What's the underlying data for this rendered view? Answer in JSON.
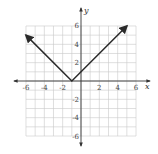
{
  "chart_data": {
    "type": "line",
    "title": "",
    "function": "y = |x + 1|",
    "xlabel": "x",
    "ylabel": "y",
    "xlim": [
      -6,
      6
    ],
    "ylim": [
      -6,
      6
    ],
    "grid": true,
    "x_ticks": [
      -6,
      -4,
      -2,
      2,
      4,
      6
    ],
    "y_ticks": [
      6,
      4,
      2,
      -2,
      -4,
      -6
    ],
    "series": [
      {
        "name": "y = |x+1|",
        "x": [
          -6,
          -1,
          5
        ],
        "y": [
          5,
          0,
          6
        ],
        "arrows": [
          "start",
          "end"
        ]
      }
    ],
    "vertex": [
      -1,
      0
    ],
    "y_intercept": [
      0,
      1
    ],
    "color": "#2a2a2a"
  },
  "labels": {
    "x_axis": "x",
    "y_axis": "y",
    "x_tick_labels": [
      "-6",
      "-4",
      "-2",
      "2",
      "4",
      "6"
    ],
    "y_tick_labels": [
      "6",
      "4",
      "2",
      "-2",
      "-4",
      "-6"
    ]
  }
}
